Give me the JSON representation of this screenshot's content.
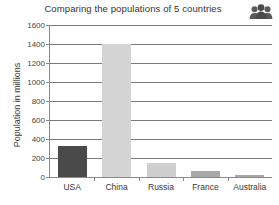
{
  "chart_data": {
    "type": "bar",
    "title": "Comparing the populations of 5 countries",
    "xlabel": "",
    "ylabel": "Population in millions",
    "categories": [
      "USA",
      "China",
      "Russia",
      "France",
      "Australia"
    ],
    "values": [
      330,
      1400,
      145,
      65,
      25
    ],
    "ylim": [
      0,
      1600
    ],
    "yticks": [
      0,
      200,
      400,
      600,
      800,
      1000,
      1200,
      1400,
      1600
    ],
    "ytick_labels": [
      "0",
      "200",
      "400",
      "600",
      "800",
      "1000",
      "1200",
      "1400",
      "1600"
    ],
    "grid": true,
    "legend": false,
    "bar_colors": [
      "#4a4a4a",
      "#d4d4d4",
      "#cfcfcf",
      "#a8a8a8",
      "#a8a8a8"
    ]
  },
  "decor": {
    "people_icon": "people-group-icon"
  },
  "colors": {
    "axis": "#8a8a8a",
    "grid": "#7a7a7a",
    "text": "#3a3a3a",
    "background": "#ffffff"
  }
}
